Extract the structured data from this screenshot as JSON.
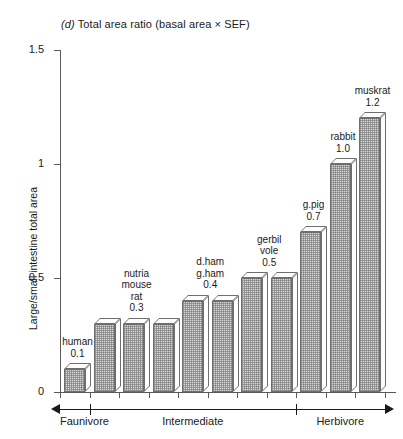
{
  "chart_data": {
    "type": "bar",
    "title": "(d) Total area ratio (basal area × SEF)",
    "title_prefix": "(d)",
    "title_rest": " Total area ratio (basal area × SEF)",
    "xlabel": "",
    "ylabel": "Large/small intestine total area",
    "ylim": [
      0,
      1.5
    ],
    "yticks": [
      0,
      0.5,
      1,
      1.5
    ],
    "ytick_labels": [
      "0",
      "0.5",
      "1",
      "1.5"
    ],
    "grid": false,
    "legend": "none",
    "categories": [
      "human",
      "nutria",
      "mouse",
      "rat",
      "d.ham",
      "g.ham",
      "gerbil",
      "vole",
      "g.pig",
      "rabbit",
      "muskrat"
    ],
    "values": [
      0.1,
      0.3,
      0.3,
      0.3,
      0.4,
      0.4,
      0.5,
      0.5,
      0.7,
      1.0,
      1.2
    ],
    "annotations": [
      {
        "text": "human\n0.1",
        "bars": [
          0
        ],
        "value": "0.1"
      },
      {
        "text": "nutria\nmouse\nrat\n0.3",
        "bars": [
          1,
          2,
          3
        ],
        "value": "0.3"
      },
      {
        "text": "d.ham\ng.ham\n0.4",
        "bars": [
          4,
          5
        ],
        "value": "0.4"
      },
      {
        "text": "gerbil\nvole\n0.5",
        "bars": [
          6,
          7
        ],
        "value": "0.5"
      },
      {
        "text": "g.pig\n0.7",
        "bars": [
          8
        ],
        "value": "0.7"
      },
      {
        "text": "rabbit\n1.0",
        "bars": [
          9
        ],
        "value": "1.0"
      },
      {
        "text": "muskrat\n1.2",
        "bars": [
          10
        ],
        "value": "1.2"
      }
    ],
    "diet_axis": [
      {
        "label": "Faunivore",
        "arrow": "left"
      },
      {
        "label": "Intermediate",
        "arrow": "none"
      },
      {
        "label": "Herbivore",
        "arrow": "right"
      }
    ],
    "colors": {
      "bar_fill": "#d7d7d7",
      "bar_edge": "#6e6e6e",
      "axis": "#5a5a5a",
      "text": "#1a1a1a"
    }
  }
}
